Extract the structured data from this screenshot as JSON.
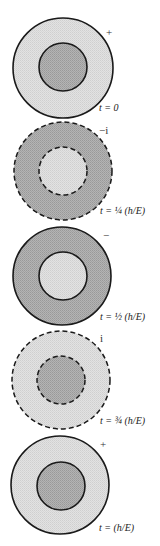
{
  "figure": {
    "colors": {
      "light_fill": "#dcdcdc",
      "dark_fill": "#a9a9a9",
      "stroke": "#1a1a1a"
    },
    "panels": [
      {
        "phase": "+",
        "time_label": "t = 0",
        "outer_shade": "light",
        "inner_shade": "dark",
        "stroke_style": "solid",
        "cx": 63,
        "cy": 68,
        "r_outer": 50,
        "r_inner": 24
      },
      {
        "phase": "−i",
        "time_label": "t = ¼ (h/E)",
        "outer_shade": "dark",
        "inner_shade": "light",
        "stroke_style": "dashed",
        "cx": 63,
        "cy": 171,
        "r_outer": 49,
        "r_inner": 24
      },
      {
        "phase": "−",
        "time_label": "t = ½ (h/E)",
        "outer_shade": "dark",
        "inner_shade": "light",
        "stroke_style": "solid",
        "cx": 62,
        "cy": 276,
        "r_outer": 49,
        "r_inner": 24
      },
      {
        "phase": "i",
        "time_label": "t = ¾ (h/E)",
        "outer_shade": "light",
        "inner_shade": "dark",
        "stroke_style": "dashed",
        "cx": 61,
        "cy": 380,
        "r_outer": 49,
        "r_inner": 24
      },
      {
        "phase": "+",
        "time_label": "t = (h/E)",
        "outer_shade": "light",
        "inner_shade": "dark",
        "stroke_style": "solid",
        "cx": 60,
        "cy": 485,
        "r_outer": 49,
        "r_inner": 24
      }
    ]
  }
}
